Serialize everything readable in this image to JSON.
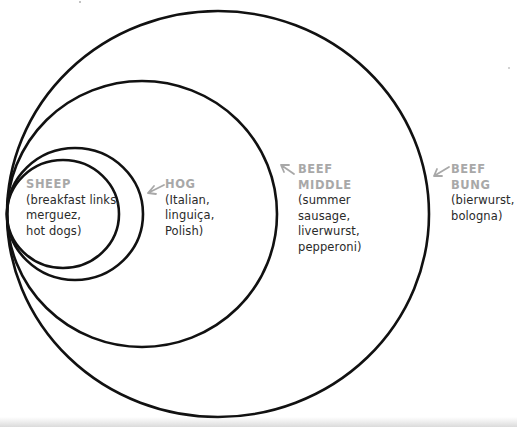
{
  "diagram": {
    "type": "nested-circles",
    "stroke_color": "#111111",
    "label_name_color": "#a8a8a8",
    "label_text_color": "#2a2a2a",
    "rings": [
      {
        "id": "beef-bung",
        "cx": 218,
        "cy": 214,
        "rx": 211,
        "ry": 203
      },
      {
        "id": "beef-middle",
        "cx": 142,
        "cy": 214,
        "rx": 135,
        "ry": 133
      },
      {
        "id": "hog",
        "cx": 75,
        "cy": 214,
        "rx": 68,
        "ry": 66
      },
      {
        "id": "sheep",
        "cx": 63,
        "cy": 214,
        "rx": 56,
        "ry": 54
      }
    ]
  },
  "labels": {
    "sheep": {
      "name": "SHEEP",
      "desc": "(breakfast links,\nmerguez,\nhot dogs)"
    },
    "hog": {
      "name": "HOG",
      "desc": "(Italian,\nlinguiça,\nPolish)"
    },
    "beef_middle": {
      "name": "BEEF\nMIDDLE",
      "desc": "(summer\nsausage,\nliverwurst,\npepperoni)"
    },
    "beef_bung": {
      "name": "BEEF\nBUNG",
      "desc": "(bierwurst,\nbologna)"
    }
  }
}
